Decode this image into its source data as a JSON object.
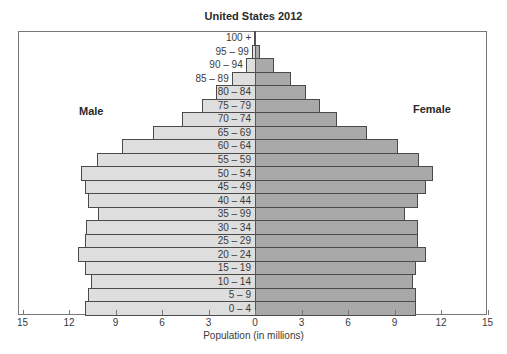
{
  "chart_data": {
    "type": "bar",
    "orientation": "horizontal",
    "subtype": "population-pyramid",
    "title": "United States 2012",
    "xlabel": "Population (in millions)",
    "ylabel": "",
    "xlim": [
      -15,
      15
    ],
    "x_ticks": [
      15,
      12,
      9,
      6,
      3,
      0,
      3,
      6,
      9,
      12,
      15
    ],
    "grid": false,
    "legend": {
      "left_label": "Male",
      "right_label": "Female"
    },
    "categories": [
      "0 – 4",
      "5 – 9",
      "10 – 14",
      "15 – 19",
      "20 – 24",
      "25 – 29",
      "30 – 34",
      "35 – 99",
      "40 – 44",
      "45 – 49",
      "50 – 54",
      "55 – 59",
      "60 – 64",
      "65 – 69",
      "70 – 74",
      "75 – 79",
      "80 – 84",
      "85 – 89",
      "90 – 94",
      "95 – 99",
      "100 +"
    ],
    "series": [
      {
        "name": "Male",
        "color": "#dedede",
        "values": [
          11.0,
          10.8,
          10.6,
          11.0,
          11.4,
          11.0,
          10.9,
          10.1,
          10.8,
          11.0,
          11.2,
          10.2,
          8.6,
          6.6,
          4.7,
          3.4,
          2.5,
          1.5,
          0.6,
          0.2,
          0.05
        ]
      },
      {
        "name": "Female",
        "color": "#a9a9a9",
        "values": [
          10.4,
          10.4,
          10.2,
          10.4,
          11.0,
          10.5,
          10.5,
          9.7,
          10.5,
          11.0,
          11.5,
          10.6,
          9.2,
          7.2,
          5.3,
          4.2,
          3.3,
          2.3,
          1.2,
          0.3,
          0.05
        ]
      }
    ]
  }
}
